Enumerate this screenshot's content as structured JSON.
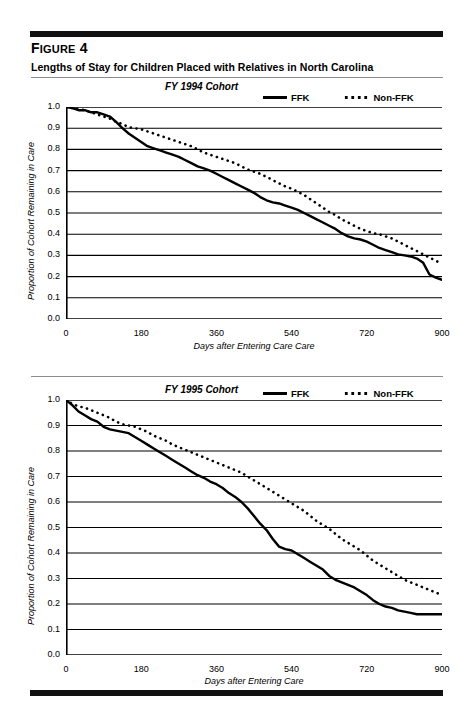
{
  "figure": {
    "label_prefix": "F",
    "label_small": "IGURE",
    "label_number": " 4",
    "label_full": "Figure 4",
    "title": "Lengths of Stay for Children Placed with Relatives in North Carolina"
  },
  "legend_labels": {
    "ffk": "FFK",
    "non_ffk": "Non-FFK"
  },
  "chart_data": [
    {
      "type": "line",
      "title": "FY 1994 Cohort",
      "xlabel": "Days after Entering Care Care",
      "ylabel": "Proportion of Cohort Remaining in Care",
      "xlim": [
        0,
        900
      ],
      "ylim": [
        0.0,
        1.0
      ],
      "xticks": [
        0,
        180,
        360,
        540,
        720,
        900
      ],
      "xtick_labels": [
        "0",
        "180",
        "360",
        "540",
        "720",
        "900"
      ],
      "xminor_step": 30,
      "yticks": [
        0.0,
        0.1,
        0.2,
        0.3,
        0.4,
        0.5,
        0.6,
        0.7,
        0.8,
        0.9,
        1.0
      ],
      "ytick_labels": [
        "0.0",
        "0.1",
        "0.2",
        "0.3",
        "0.4",
        "0.5",
        "0.6",
        "0.7",
        "0.8",
        "0.9",
        "1.0"
      ],
      "grid": true,
      "legend_position": "top-right",
      "series": [
        {
          "name": "FFK",
          "style": "solid",
          "x": [
            0,
            15,
            30,
            45,
            60,
            75,
            90,
            105,
            120,
            135,
            150,
            165,
            180,
            195,
            210,
            225,
            240,
            255,
            270,
            285,
            300,
            315,
            330,
            345,
            360,
            375,
            390,
            405,
            420,
            435,
            450,
            465,
            480,
            495,
            510,
            525,
            540,
            555,
            570,
            585,
            600,
            615,
            630,
            645,
            660,
            675,
            690,
            705,
            720,
            735,
            750,
            765,
            780,
            795,
            810,
            825,
            840,
            855,
            870,
            885,
            900
          ],
          "y": [
            1.0,
            0.995,
            0.985,
            0.985,
            0.975,
            0.975,
            0.965,
            0.955,
            0.93,
            0.9,
            0.875,
            0.855,
            0.835,
            0.815,
            0.805,
            0.795,
            0.785,
            0.775,
            0.765,
            0.75,
            0.735,
            0.72,
            0.71,
            0.7,
            0.685,
            0.67,
            0.655,
            0.64,
            0.625,
            0.61,
            0.595,
            0.575,
            0.56,
            0.55,
            0.545,
            0.535,
            0.525,
            0.515,
            0.5,
            0.485,
            0.47,
            0.455,
            0.44,
            0.425,
            0.405,
            0.39,
            0.38,
            0.375,
            0.365,
            0.35,
            0.335,
            0.325,
            0.315,
            0.305,
            0.3,
            0.295,
            0.285,
            0.265,
            0.21,
            0.195,
            0.185
          ]
        },
        {
          "name": "Non-FFK",
          "style": "dotted",
          "x": [
            0,
            15,
            30,
            45,
            60,
            75,
            90,
            105,
            120,
            135,
            150,
            165,
            180,
            195,
            210,
            225,
            240,
            255,
            270,
            285,
            300,
            315,
            330,
            345,
            360,
            375,
            390,
            405,
            420,
            435,
            450,
            465,
            480,
            495,
            510,
            525,
            540,
            555,
            570,
            585,
            600,
            615,
            630,
            645,
            660,
            675,
            690,
            705,
            720,
            735,
            750,
            765,
            780,
            795,
            810,
            825,
            840,
            855,
            870,
            885,
            900
          ],
          "y": [
            1.0,
            0.995,
            0.99,
            0.985,
            0.975,
            0.965,
            0.955,
            0.945,
            0.93,
            0.92,
            0.905,
            0.9,
            0.895,
            0.885,
            0.875,
            0.865,
            0.855,
            0.845,
            0.835,
            0.825,
            0.815,
            0.8,
            0.785,
            0.775,
            0.765,
            0.755,
            0.745,
            0.735,
            0.72,
            0.705,
            0.695,
            0.685,
            0.67,
            0.655,
            0.64,
            0.625,
            0.615,
            0.6,
            0.585,
            0.565,
            0.545,
            0.525,
            0.505,
            0.49,
            0.47,
            0.455,
            0.44,
            0.425,
            0.415,
            0.405,
            0.4,
            0.39,
            0.38,
            0.365,
            0.35,
            0.335,
            0.32,
            0.305,
            0.29,
            0.275,
            0.26
          ]
        }
      ]
    },
    {
      "type": "line",
      "title": "FY 1995 Cohort",
      "xlabel": "Days after Entering Care",
      "ylabel": "Proportion of Cohort Remaining in Care",
      "xlim": [
        0,
        900
      ],
      "ylim": [
        0.0,
        1.0
      ],
      "xticks": [
        0,
        180,
        360,
        540,
        720,
        900
      ],
      "xtick_labels": [
        "0",
        "180",
        "360",
        "540",
        "720",
        "900"
      ],
      "xminor_step": 30,
      "yticks": [
        0.0,
        0.1,
        0.2,
        0.3,
        0.4,
        0.5,
        0.6,
        0.7,
        0.8,
        0.9,
        1.0
      ],
      "ytick_labels": [
        "0.0",
        "0.1",
        "0.2",
        "0.3",
        "0.4",
        "0.5",
        "0.6",
        "0.7",
        "0.8",
        "0.9",
        "1.0"
      ],
      "grid": true,
      "legend_position": "top-right",
      "series": [
        {
          "name": "FFK",
          "style": "solid",
          "x": [
            0,
            15,
            30,
            45,
            60,
            75,
            90,
            105,
            120,
            135,
            150,
            165,
            180,
            195,
            210,
            225,
            240,
            255,
            270,
            285,
            300,
            315,
            330,
            345,
            360,
            375,
            390,
            405,
            420,
            435,
            450,
            465,
            480,
            495,
            510,
            525,
            540,
            555,
            570,
            585,
            600,
            615,
            630,
            645,
            660,
            675,
            690,
            705,
            720,
            735,
            750,
            765,
            780,
            795,
            810,
            825,
            840,
            855,
            870,
            885,
            900
          ],
          "y": [
            1.0,
            0.98,
            0.955,
            0.94,
            0.925,
            0.915,
            0.895,
            0.885,
            0.88,
            0.875,
            0.87,
            0.855,
            0.84,
            0.825,
            0.81,
            0.795,
            0.78,
            0.765,
            0.75,
            0.735,
            0.72,
            0.705,
            0.695,
            0.68,
            0.67,
            0.655,
            0.635,
            0.62,
            0.6,
            0.575,
            0.545,
            0.515,
            0.49,
            0.455,
            0.425,
            0.415,
            0.41,
            0.395,
            0.38,
            0.365,
            0.35,
            0.335,
            0.31,
            0.295,
            0.285,
            0.275,
            0.265,
            0.25,
            0.235,
            0.215,
            0.2,
            0.19,
            0.185,
            0.175,
            0.17,
            0.165,
            0.16,
            0.16,
            0.16,
            0.16,
            0.16
          ]
        },
        {
          "name": "Non-FFK",
          "style": "dotted",
          "x": [
            0,
            15,
            30,
            45,
            60,
            75,
            90,
            105,
            120,
            135,
            150,
            165,
            180,
            195,
            210,
            225,
            240,
            255,
            270,
            285,
            300,
            315,
            330,
            345,
            360,
            375,
            390,
            405,
            420,
            435,
            450,
            465,
            480,
            495,
            510,
            525,
            540,
            555,
            570,
            585,
            600,
            615,
            630,
            645,
            660,
            675,
            690,
            705,
            720,
            735,
            750,
            765,
            780,
            795,
            810,
            825,
            840,
            855,
            870,
            885,
            900
          ],
          "y": [
            1.0,
            0.985,
            0.975,
            0.97,
            0.96,
            0.95,
            0.94,
            0.93,
            0.915,
            0.905,
            0.9,
            0.895,
            0.885,
            0.875,
            0.86,
            0.85,
            0.84,
            0.825,
            0.815,
            0.805,
            0.795,
            0.785,
            0.775,
            0.765,
            0.755,
            0.745,
            0.735,
            0.725,
            0.715,
            0.7,
            0.685,
            0.67,
            0.655,
            0.64,
            0.625,
            0.61,
            0.595,
            0.58,
            0.565,
            0.545,
            0.525,
            0.51,
            0.495,
            0.475,
            0.455,
            0.44,
            0.425,
            0.41,
            0.39,
            0.37,
            0.355,
            0.34,
            0.325,
            0.31,
            0.295,
            0.285,
            0.275,
            0.265,
            0.255,
            0.245,
            0.235
          ]
        }
      ]
    }
  ]
}
